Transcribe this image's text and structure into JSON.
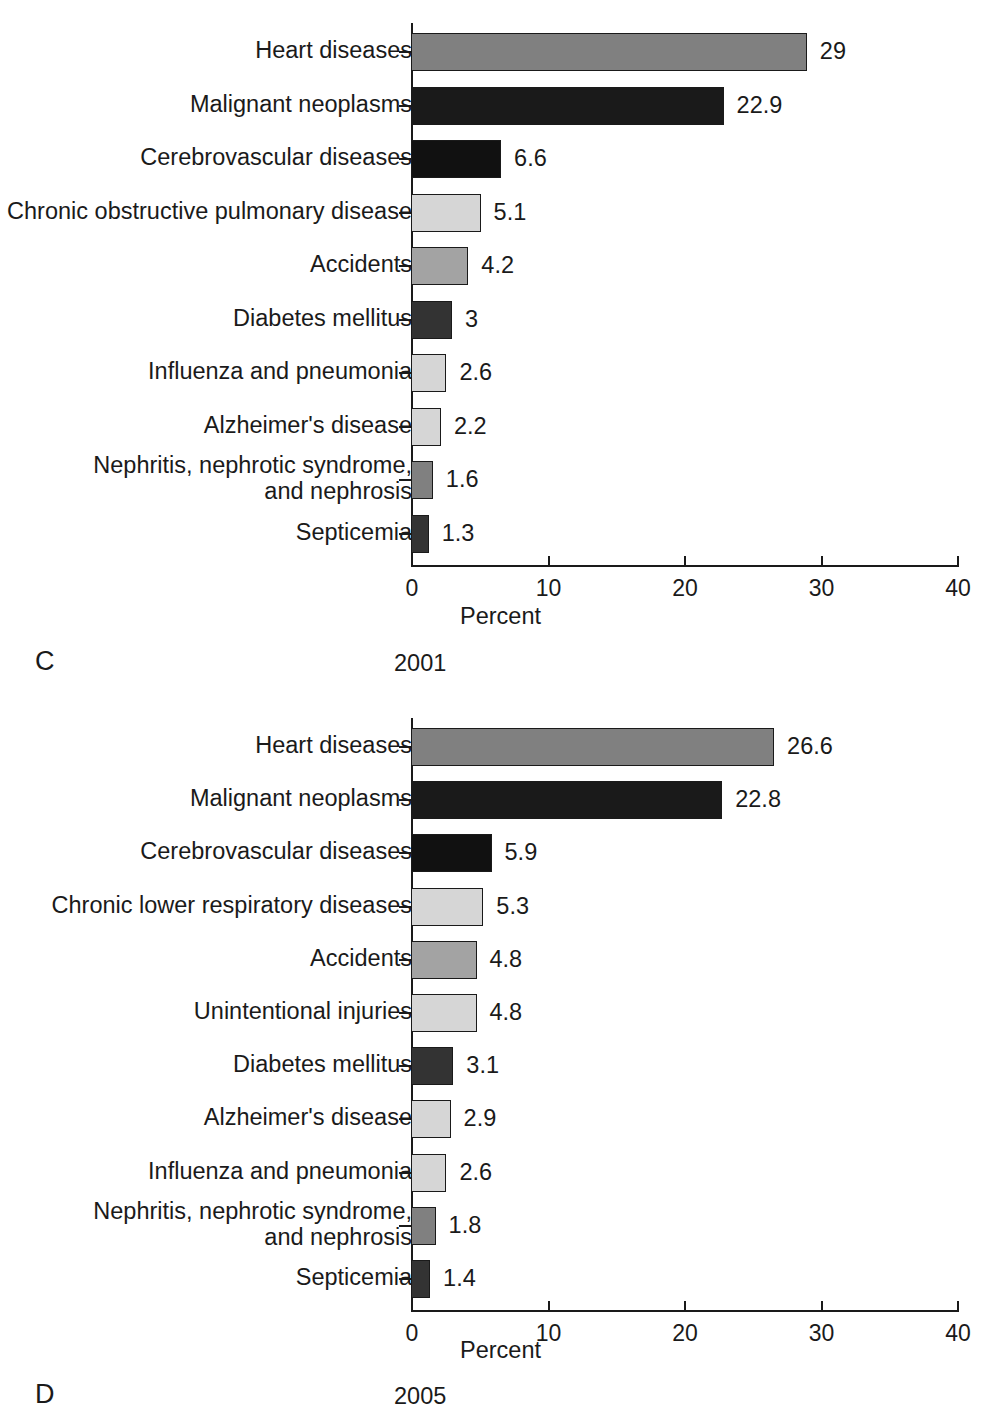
{
  "figure": {
    "background": "#ffffff",
    "axis_color": "#1a1a1a"
  },
  "palette": {
    "dark_gray": "#808080",
    "near_black": "#1a1a1a",
    "black": "#111111",
    "light_gray": "#d6d6d6",
    "medium_gray": "#a3a3a3",
    "charcoal": "#333333"
  },
  "panels": [
    {
      "letter": "C",
      "year": "2001",
      "xlabel": "Percent",
      "ticks": [
        "0",
        "10",
        "20",
        "30",
        "40"
      ]
    },
    {
      "letter": "D",
      "year": "2005",
      "xlabel": "Percent",
      "ticks": [
        "0",
        "10",
        "20",
        "30",
        "40"
      ]
    }
  ],
  "chart_data": [
    {
      "type": "bar",
      "orientation": "horizontal",
      "title": "2001",
      "panel_letter": "C",
      "xlabel": "Percent",
      "ylabel": "",
      "xlim": [
        0,
        40
      ],
      "xticks": [
        0,
        10,
        20,
        30,
        40
      ],
      "grid": false,
      "legend": "none",
      "categories": [
        "Heart diseases",
        "Malignant neoplasms",
        "Cerebrovascular diseases",
        "Chronic obstructive pulmonary disease",
        "Accidents",
        "Diabetes mellitus",
        "Influenza and pneumonia",
        "Alzheimer's disease",
        "Nephritis, nephrotic syndrome,\nand nephrosis",
        "Septicemia"
      ],
      "values": [
        29,
        22.9,
        6.6,
        5.1,
        4.2,
        3,
        2.6,
        2.2,
        1.6,
        1.3
      ],
      "value_labels": [
        "29",
        "22.9",
        "6.6",
        "5.1",
        "4.2",
        "3",
        "2.6",
        "2.2",
        "1.6",
        "1.3"
      ],
      "bar_colors": [
        "#808080",
        "#1a1a1a",
        "#111111",
        "#d6d6d6",
        "#a3a3a3",
        "#333333",
        "#d6d6d6",
        "#d6d6d6",
        "#808080",
        "#333333"
      ]
    },
    {
      "type": "bar",
      "orientation": "horizontal",
      "title": "2005",
      "panel_letter": "D",
      "xlabel": "Percent",
      "ylabel": "",
      "xlim": [
        0,
        40
      ],
      "xticks": [
        0,
        10,
        20,
        30,
        40
      ],
      "grid": false,
      "legend": "none",
      "categories": [
        "Heart diseases",
        "Malignant neoplasms",
        "Cerebrovascular diseases",
        "Chronic lower respiratory diseases",
        "Accidents",
        "Unintentional injuries",
        "Diabetes mellitus",
        "Alzheimer's disease",
        "Influenza and pneumonia",
        "Nephritis, nephrotic syndrome,\nand nephrosis",
        "Septicemia"
      ],
      "values": [
        26.6,
        22.8,
        5.9,
        5.3,
        4.8,
        4.8,
        3.1,
        2.9,
        2.6,
        1.8,
        1.4
      ],
      "value_labels": [
        "26.6",
        "22.8",
        "5.9",
        "5.3",
        "4.8",
        "4.8",
        "3.1",
        "2.9",
        "2.6",
        "1.8",
        "1.4"
      ],
      "bar_colors": [
        "#808080",
        "#1a1a1a",
        "#111111",
        "#d6d6d6",
        "#a3a3a3",
        "#d6d6d6",
        "#333333",
        "#d6d6d6",
        "#d6d6d6",
        "#808080",
        "#333333"
      ]
    }
  ]
}
